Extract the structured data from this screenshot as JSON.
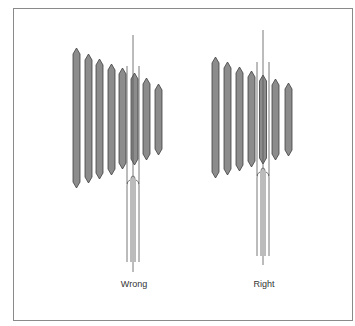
{
  "colors": {
    "strip_fill": "#8c8c8c",
    "strip_stroke": "#3f3f3f",
    "line": "#555555",
    "frame": "#8a8a8a",
    "text": "#333333"
  },
  "panels": [
    {
      "label": "Wrong",
      "label_x": 134,
      "label_y": 279,
      "strips": [
        {
          "x": 73,
          "top": 48,
          "bottom": 188
        },
        {
          "x": 85,
          "top": 54,
          "bottom": 183
        },
        {
          "x": 96,
          "top": 59,
          "bottom": 179
        },
        {
          "x": 108,
          "top": 64,
          "bottom": 175
        },
        {
          "x": 119,
          "top": 68,
          "bottom": 169
        },
        {
          "x": 131,
          "top": 73,
          "bottom": 165
        },
        {
          "x": 143,
          "top": 78,
          "bottom": 160
        },
        {
          "x": 155,
          "top": 84,
          "bottom": 155
        }
      ],
      "tool": {
        "center_x": 133,
        "center_top": 35,
        "center_bottom": 272,
        "outer_left": 127,
        "outer_right": 139,
        "guide_top": 66,
        "arch_top": 176,
        "outer_start": 185,
        "inner_left": 131,
        "inner_right": 135,
        "bottom": 262
      }
    },
    {
      "label": "Right",
      "label_x": 264,
      "label_y": 279,
      "strips": [
        {
          "x": 212,
          "top": 57,
          "bottom": 178
        },
        {
          "x": 224,
          "top": 62,
          "bottom": 175
        },
        {
          "x": 236,
          "top": 67,
          "bottom": 171
        },
        {
          "x": 248,
          "top": 71,
          "bottom": 167
        },
        {
          "x": 259.5,
          "top": 75,
          "bottom": 164
        },
        {
          "x": 272,
          "top": 79,
          "bottom": 160
        },
        {
          "x": 285,
          "top": 83,
          "bottom": 156
        }
      ],
      "tool": {
        "center_x": 263,
        "center_top": 30,
        "center_bottom": 265,
        "outer_left": 257,
        "outer_right": 269,
        "guide_top": 62,
        "arch_top": 168,
        "outer_start": 177,
        "inner_left": 261,
        "inner_right": 265,
        "bottom": 256
      }
    }
  ]
}
